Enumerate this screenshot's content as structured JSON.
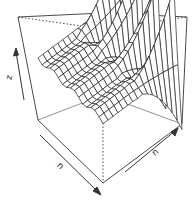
{
  "chart_data": {
    "type": "surface3d",
    "title": "",
    "xlabel": "n",
    "ylabel": "n",
    "zlabel": "z",
    "grid": false,
    "box": true,
    "axis_arrows": true,
    "spikes": [
      {
        "x_frac": 0.05,
        "height": 0.95
      },
      {
        "x_frac": 0.2,
        "height": 0.85
      },
      {
        "x_frac": 0.4,
        "height": 0.8
      },
      {
        "x_frac": 0.62,
        "height": 0.6
      }
    ],
    "colors": {
      "line": "#333333",
      "box": "#333333",
      "background": "#ffffff"
    }
  },
  "axes": {
    "x_label": "n",
    "y_label": "n",
    "z_label": "z"
  }
}
